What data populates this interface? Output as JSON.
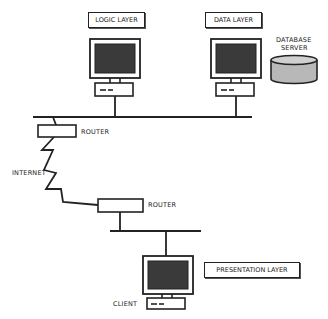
{
  "labels": {
    "logic_layer": "LOGIC LAYER",
    "data_layer": "DATA LAYER",
    "database_server_line1": "DATABASE",
    "database_server_line2": "SERVER",
    "router_top": "ROUTER",
    "router_bottom": "ROUTER",
    "internet": "INTERNET",
    "presentation_layer": "PRESENTATION LAYER",
    "client": "CLIENT"
  },
  "colors": {
    "stroke": "#222222",
    "screen": "#3a3a3a",
    "database": "#b8b8b8"
  }
}
